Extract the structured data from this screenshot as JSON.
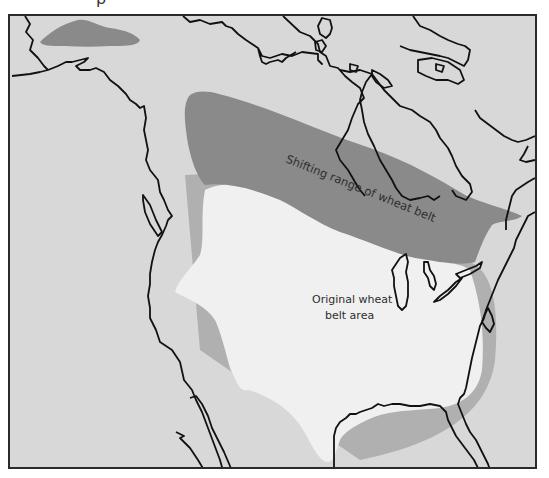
{
  "map": {
    "title_fragment": "p",
    "labels": {
      "shifting_range": "Shifting range of wheat belt",
      "original_area_line1": "Original wheat",
      "original_area_line2": "belt area"
    },
    "legend_colors": {
      "background": "#d8d8d8",
      "original_wheat_belt": "#f0f0f0",
      "shifting_range": "#8a8a8a",
      "transition_band": "#b0b0b0",
      "coastline": "#111111",
      "frame": "#2a2a2a"
    },
    "regions": [
      {
        "name": "Original wheat belt area",
        "shade": "near-white"
      },
      {
        "name": "Shifting range of wheat belt",
        "shade": "dark gray"
      },
      {
        "name": "Northern Alaska wheat range patch",
        "shade": "dark gray"
      }
    ]
  }
}
